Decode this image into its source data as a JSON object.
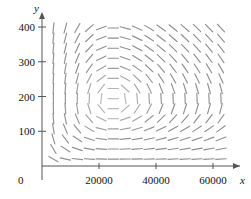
{
  "figure": {
    "type": "direction-field",
    "title": "",
    "background": "#ffffff",
    "stroke_color": "#8a8a8a",
    "axis_color": "#555555"
  },
  "axes": {
    "x": {
      "label": "x",
      "ticks": [
        0,
        20000,
        40000,
        60000
      ],
      "tick_labels": [
        "0",
        "20000",
        "40000",
        "60000"
      ],
      "range": [
        0,
        68000
      ],
      "arrow": true
    },
    "y": {
      "label": "y",
      "ticks": [
        100,
        200,
        300,
        400
      ],
      "tick_labels": [
        "100",
        "200",
        "300",
        "400"
      ],
      "range": [
        0,
        440
      ],
      "arrow": true
    },
    "origin_label": "0"
  },
  "chart_data": {
    "type": "scatter",
    "title": "",
    "xlabel": "x",
    "ylabel": "y",
    "xlim": [
      0,
      68000
    ],
    "ylim": [
      0,
      440
    ],
    "grid": false,
    "legend": null,
    "center": {
      "x": 25000,
      "y": 190
    },
    "grid_spec": {
      "x_start": 4000,
      "x_step": 4200,
      "x_count": 15,
      "y_start": 20,
      "y_step": 29,
      "y_count": 14
    },
    "tick_values": {
      "x": [
        0,
        20000,
        40000,
        60000
      ],
      "y": [
        100,
        200,
        300,
        400
      ]
    }
  }
}
